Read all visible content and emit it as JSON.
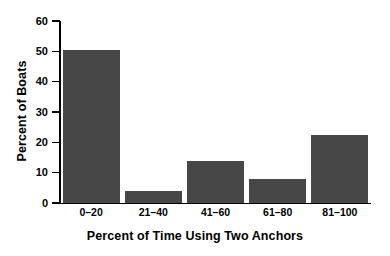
{
  "chart_data": {
    "type": "bar",
    "title": "",
    "subtitle": "",
    "xlabel": "Percent of Time Using Two Anchors",
    "ylabel": "Percent of Boats",
    "categories": [
      "0–20",
      "21–40",
      "41–60",
      "61–80",
      "81–100"
    ],
    "values": [
      50.5,
      4.0,
      14.0,
      8.0,
      22.5
    ],
    "ylim": [
      0,
      60
    ],
    "yticks": [
      0,
      10,
      20,
      30,
      40,
      50,
      60
    ],
    "ytick_labels": [
      "0",
      "10",
      "20",
      "30",
      "40",
      "50",
      "60"
    ],
    "grid": false,
    "legend": null,
    "bar_color": "#474747",
    "axis_color": "#000000",
    "background_color": "#ffffff"
  }
}
